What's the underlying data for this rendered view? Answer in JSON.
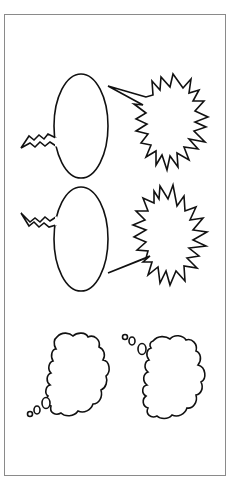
{
  "frame": {
    "border_color": "#8a8a8a",
    "background": "#ffffff"
  },
  "stroke_color": "#111111",
  "bubbles": [
    {
      "kind": "speech-oval",
      "tail": "zigzag",
      "tail_direction": "left",
      "label": "Electric speech bubble 1"
    },
    {
      "kind": "starburst",
      "tail": "spike",
      "tail_direction": "upper-left",
      "label": "Shout bubble 1"
    },
    {
      "kind": "speech-oval",
      "tail": "zigzag",
      "tail_direction": "upper-left",
      "label": "Electric speech bubble 2"
    },
    {
      "kind": "starburst",
      "tail": "spike",
      "tail_direction": "lower-left",
      "label": "Shout bubble 2"
    },
    {
      "kind": "thought-cloud",
      "tail": "bubbles",
      "tail_direction": "lower-left",
      "label": "Thought bubble 1"
    },
    {
      "kind": "thought-cloud",
      "tail": "bubbles",
      "tail_direction": "upper-left",
      "label": "Thought bubble 2"
    }
  ]
}
